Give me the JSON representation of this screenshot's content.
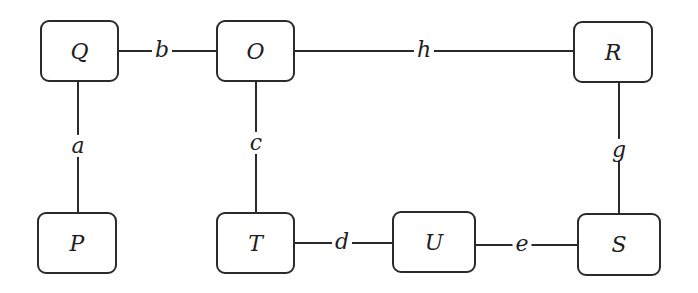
{
  "diagram": {
    "type": "graph",
    "line_color": "#2a2a2a",
    "nodes": [
      {
        "id": "Q",
        "label": "Q",
        "x": 40,
        "y": 20,
        "w": 79,
        "h": 62
      },
      {
        "id": "O",
        "label": "O",
        "x": 216,
        "y": 20,
        "w": 79,
        "h": 62
      },
      {
        "id": "R",
        "label": "R",
        "x": 573,
        "y": 21,
        "w": 80,
        "h": 62
      },
      {
        "id": "P",
        "label": "P",
        "x": 37,
        "y": 212,
        "w": 80,
        "h": 62
      },
      {
        "id": "T",
        "label": "T",
        "x": 216,
        "y": 212,
        "w": 79,
        "h": 62
      },
      {
        "id": "U",
        "label": "U",
        "x": 392,
        "y": 211,
        "w": 84,
        "h": 62
      },
      {
        "id": "S",
        "label": "S",
        "x": 577,
        "y": 213,
        "w": 84,
        "h": 63
      }
    ],
    "edges": [
      {
        "label": "a",
        "from": "Q",
        "to": "P",
        "x1": 78,
        "y1": 82,
        "x2": 78,
        "y2": 212,
        "lx": 78,
        "ly": 147
      },
      {
        "label": "b",
        "from": "Q",
        "to": "O",
        "x1": 119,
        "y1": 51,
        "x2": 216,
        "y2": 51,
        "lx": 162,
        "ly": 51
      },
      {
        "label": "c",
        "from": "O",
        "to": "T",
        "x1": 256,
        "y1": 82,
        "x2": 256,
        "y2": 212,
        "lx": 256,
        "ly": 144
      },
      {
        "label": "d",
        "from": "T",
        "to": "U",
        "x1": 295,
        "y1": 243,
        "x2": 392,
        "y2": 243,
        "lx": 342,
        "ly": 243
      },
      {
        "label": "e",
        "from": "U",
        "to": "S",
        "x1": 476,
        "y1": 245,
        "x2": 577,
        "y2": 245,
        "lx": 522,
        "ly": 245
      },
      {
        "label": "g",
        "from": "R",
        "to": "S",
        "x1": 619,
        "y1": 83,
        "x2": 619,
        "y2": 213,
        "lx": 619,
        "ly": 151
      },
      {
        "label": "h",
        "from": "O",
        "to": "R",
        "x1": 295,
        "y1": 51,
        "x2": 573,
        "y2": 51,
        "lx": 424,
        "ly": 51
      }
    ]
  }
}
